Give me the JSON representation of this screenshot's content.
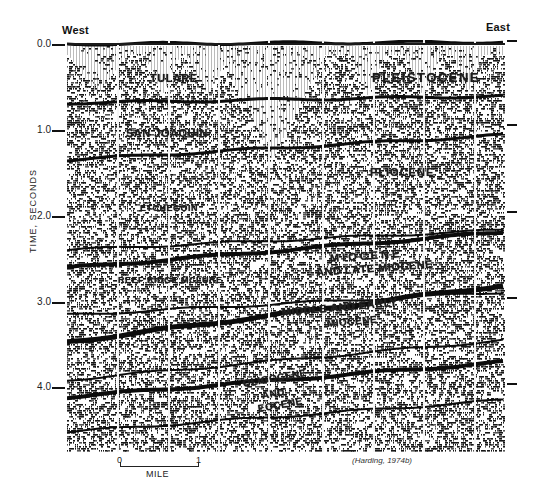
{
  "figure": {
    "west_label": "West",
    "east_label": "East",
    "y_axis_title": "TIME, SECONDS",
    "y_ticks_left": [
      "0.0",
      "1.0",
      "2.0",
      "3.0",
      "4.0"
    ],
    "y_tick_values": [
      0.0,
      1.0,
      2.0,
      3.0,
      4.0
    ],
    "y_range_seconds": [
      0.0,
      4.8
    ],
    "scale_bar": {
      "start": "0",
      "end": "1",
      "unit": "MILE"
    },
    "credit": "(Harding, 1974b)"
  },
  "units": [
    {
      "label": "TULARE"
    },
    {
      "label": "PLEISTOCENE"
    },
    {
      "label": "SAN JOAQUIN"
    },
    {
      "label": "PLIOCENE"
    },
    {
      "label": "ETCHEGOIN"
    },
    {
      "label": "MIOCENE"
    },
    {
      "label": "AND LATE MIOCENE"
    },
    {
      "label": "REEF RIDGE MCLURE"
    },
    {
      "label": "MIDDLE AND EARLY"
    },
    {
      "label": "MIOCENE"
    },
    {
      "label": "OLIGOCENE"
    },
    {
      "label": "AND"
    },
    {
      "label": "EOCENE"
    }
  ],
  "colors": {
    "ink": "#141414",
    "paper": "#ffffff"
  }
}
